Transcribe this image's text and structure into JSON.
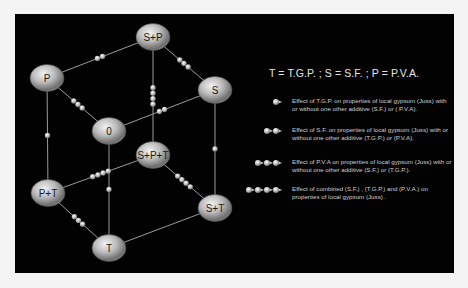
{
  "colors": {
    "background": "#f4f4f4",
    "panel": "#020202",
    "node_fill": "#b8b8b8",
    "edge": "#9a9a9a",
    "text": "#e6e6e6"
  },
  "diagram": {
    "type": "cube-lattice",
    "nodes": [
      {
        "id": "S+P",
        "label": "S+P",
        "x": 153,
        "y": 37
      },
      {
        "id": "P",
        "label": "P",
        "x": 47,
        "y": 78
      },
      {
        "id": "S",
        "label": "S",
        "x": 215,
        "y": 90
      },
      {
        "id": "0",
        "label": "0",
        "x": 109,
        "y": 131
      },
      {
        "id": "S+P+T",
        "label": "S+P+T",
        "x": 153,
        "y": 155
      },
      {
        "id": "P+T",
        "label": "P+T",
        "x": 48,
        "y": 193
      },
      {
        "id": "S+T",
        "label": "S+T",
        "x": 215,
        "y": 208
      },
      {
        "id": "T",
        "label": "T",
        "x": 109,
        "y": 248
      }
    ],
    "edges": [
      {
        "from": "P",
        "to": "S+P",
        "effect": "S.F.",
        "markers": 2
      },
      {
        "from": "S",
        "to": "S+P",
        "effect": "P.V.A.",
        "markers": 3
      },
      {
        "from": "0",
        "to": "P",
        "effect": "P.V.A.",
        "markers": 3
      },
      {
        "from": "0",
        "to": "S",
        "effect": "S.F.",
        "markers": 2
      },
      {
        "from": "S+P",
        "to": "S+P+T",
        "effect": "combined",
        "markers": 4
      },
      {
        "from": "P",
        "to": "P+T",
        "effect": "T.G.P.",
        "markers": 1
      },
      {
        "from": "S",
        "to": "S+T",
        "effect": "T.G.P.",
        "markers": 1
      },
      {
        "from": "0",
        "to": "T",
        "effect": "T.G.P.",
        "markers": 1
      },
      {
        "from": "P+T",
        "to": "S+P+T",
        "effect": "combined",
        "markers": 4
      },
      {
        "from": "S+T",
        "to": "S+P+T",
        "effect": "combined",
        "markers": 4
      },
      {
        "from": "T",
        "to": "P+T",
        "effect": "P.V.A.",
        "markers": 3
      },
      {
        "from": "T",
        "to": "S+T",
        "effect": "S.F.",
        "markers": 0
      }
    ]
  },
  "key": {
    "title": "T = T.G.P.  ; S = S.F. ; P = P.V.A.",
    "legend": [
      {
        "markers": 1,
        "text": "Effect of T.G.P. on properties of local gypsum (Juss) with or without one other additive (S.F.) or ( P.V.A)."
      },
      {
        "markers": 2,
        "text": "Effect of S.F. on properties of local gypsum (Juss) with or without one other additive (T.G.P.) or  (P.V.A)."
      },
      {
        "markers": 3,
        "text": "Effect of P.V.A on properties of local gypsum (Juss) with or without one other additive (S.F.) or (T.G.P.)."
      },
      {
        "markers": 4,
        "text": "Effect of combined (S.F.) , (T.G.P.) and (P.V.A.) on properties of local gypsum (Juss) ."
      }
    ]
  }
}
